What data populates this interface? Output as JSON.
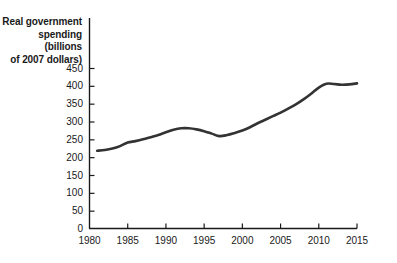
{
  "chart_data": {
    "type": "line",
    "title": "",
    "ylabel": "Real government spending (billions of 2007 dollars)",
    "xlabel": "",
    "xlim": [
      1980,
      2015
    ],
    "ylim": [
      0,
      460
    ],
    "grid": false,
    "legend": null,
    "y_ticks": [
      0,
      50,
      100,
      150,
      200,
      250,
      300,
      350,
      400,
      450
    ],
    "y_tick_labels": [
      "0",
      "50",
      "100",
      "150",
      "200",
      "250",
      "300",
      "350",
      "400",
      "450"
    ],
    "x_ticks": [
      1980,
      1985,
      1990,
      1995,
      2000,
      2005,
      2010,
      2015
    ],
    "x_tick_labels": [
      "1980",
      "1985",
      "1990",
      "1995",
      "2000",
      "2005",
      "2010",
      "2015"
    ],
    "line_color": "#333333",
    "series": [
      {
        "name": "Real government spending",
        "x": [
          1981,
          1982,
          1983,
          1984,
          1985,
          1986,
          1987,
          1988,
          1989,
          1990,
          1991,
          1992,
          1993,
          1994,
          1995,
          1996,
          1997,
          1998,
          1999,
          2000,
          2001,
          2002,
          2003,
          2004,
          2005,
          2006,
          2007,
          2008,
          2009,
          2010,
          2011,
          2012,
          2013,
          2014,
          2015
        ],
        "values": [
          218,
          220,
          224,
          231,
          241,
          245,
          250,
          256,
          262,
          270,
          277,
          281,
          281,
          278,
          273,
          266,
          259,
          262,
          268,
          275,
          284,
          295,
          305,
          315,
          325,
          336,
          348,
          362,
          378,
          395,
          406,
          405,
          403,
          404,
          407
        ]
      }
    ]
  },
  "axis_label": {
    "line1": "Real government",
    "line2": "spending (billions",
    "line3": "of 2007 dollars)"
  }
}
